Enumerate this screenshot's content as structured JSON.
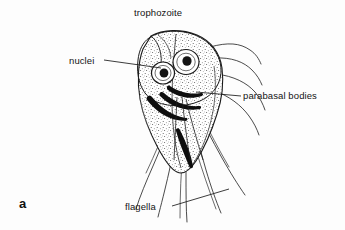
{
  "figure": {
    "domain": "scientific-illustration",
    "panel_letter": "a",
    "background_color": "#fdfdfd",
    "ink_color": "#1a1a1a",
    "labels": {
      "title": "trophozoite",
      "nuclei": "nuclei",
      "parabasal_bodies": "parabasal bodies",
      "flagella": "flagella"
    },
    "leader_lines": [
      {
        "name": "nuclei-leader",
        "from": [
          104,
          60
        ],
        "to": [
          161,
          68
        ]
      },
      {
        "name": "parabasal-leader",
        "from": [
          241,
          96
        ],
        "to": [
          196,
          92
        ]
      },
      {
        "name": "flagella-leader",
        "from": [
          172,
          206
        ],
        "to": [
          229,
          189
        ]
      }
    ],
    "structures": [
      {
        "name": "left-nucleus",
        "center": [
          163,
          73
        ],
        "radius": 11
      },
      {
        "name": "right-nucleus",
        "center": [
          186,
          63
        ],
        "radius": 13
      },
      {
        "name": "body-outline",
        "note": "pear-shaped stippled trophozoite body"
      },
      {
        "name": "parabasal-bodies",
        "note": "dark curved bars beneath nuclei"
      },
      {
        "name": "flagella",
        "count": 8,
        "note": "long tapering whip-like projections"
      }
    ]
  }
}
